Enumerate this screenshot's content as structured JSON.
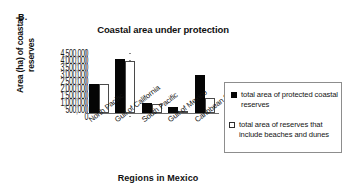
{
  "panel": {
    "label": "B."
  },
  "chart_data": {
    "type": "bar",
    "title": "Coastal area under protection",
    "xlabel": "Regions in Mexico",
    "ylabel": "Area (ha) of coastal reserves",
    "categories": [
      "North Pacific",
      "Gulf of California",
      "South Pacific",
      "Gulf of Mexico",
      "Caribbean Sea"
    ],
    "series": [
      {
        "name": "total area of protected coastal reserves",
        "color": "#050505",
        "values": [
          2100000,
          3850000,
          700000,
          450000,
          2700000
        ]
      },
      {
        "name": "total area of reserves that include beaches and dunes",
        "color": "#ffffff",
        "values": [
          2100000,
          3700000,
          620000,
          30000,
          1100000
        ]
      }
    ],
    "ylim": [
      0,
      4500000
    ],
    "ytick_labels": [
      "4,500,000",
      "4,000,000",
      "3,500,000",
      "3,000,000",
      "2,500,000",
      "2,000,000",
      "1,500,000",
      "1,000,000",
      "500,000",
      "0"
    ],
    "ytick_values": [
      4500000,
      4000000,
      3500000,
      3000000,
      2500000,
      2000000,
      1500000,
      1000000,
      500000,
      0
    ],
    "grid": false,
    "legend_position": "right"
  },
  "legend": {
    "entries": [
      {
        "marker": "filled-square",
        "line1": "total area of protected",
        "line2": "coastal reserves",
        "line3": ""
      },
      {
        "marker": "open-square",
        "line1": "total area of reserves",
        "line2": "that include beaches",
        "line3": "and dunes"
      }
    ]
  }
}
